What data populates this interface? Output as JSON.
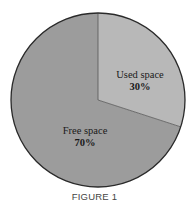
{
  "figure": {
    "caption": "FIGURE 1"
  },
  "chart_data": {
    "type": "pie",
    "title": "",
    "caption": "FIGURE 1",
    "categories": [
      "Used space",
      "Free space"
    ],
    "values": [
      30,
      70
    ],
    "units": "%",
    "labels": [
      {
        "name": "Used space",
        "value_label": "30%"
      },
      {
        "name": "Free space",
        "value_label": "70%"
      }
    ],
    "start_angle_deg": 0,
    "direction": "clockwise",
    "colors": {
      "Used space": "#b8b8b8",
      "Free space": "#9c9c9c",
      "outline": "#2a2a2a"
    },
    "legend": "none (labels inside slices)"
  },
  "slices": {
    "used": {
      "label": "Used space",
      "pct": "30%"
    },
    "free": {
      "label": "Free space",
      "pct": "70%"
    }
  }
}
